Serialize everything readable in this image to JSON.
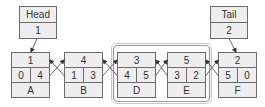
{
  "diagram": {
    "type": "doubly-linked-list",
    "head": {
      "label": "Head",
      "value": "1"
    },
    "tail": {
      "label": "Tail",
      "value": "2"
    },
    "nodes": [
      {
        "id": "1",
        "prev": "0",
        "next": "4",
        "name": "A"
      },
      {
        "id": "4",
        "prev": "1",
        "next": "3",
        "name": "B"
      },
      {
        "id": "3",
        "prev": "4",
        "next": "5",
        "name": "D"
      },
      {
        "id": "5",
        "prev": "3",
        "next": "2",
        "name": "E"
      },
      {
        "id": "2",
        "prev": "5",
        "next": "0",
        "name": "F"
      }
    ],
    "highlighted_group": [
      "D",
      "E"
    ],
    "colors": {
      "cell_fill": "#eeeeee",
      "cell_border": "#6b6b6b",
      "frame": "#9a9a9a",
      "text": "#333333"
    }
  }
}
